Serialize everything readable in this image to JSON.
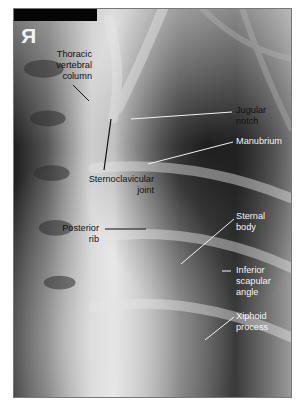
{
  "figure": {
    "orientation_marker": "R",
    "labels": {
      "thoracic_vertebral_column": [
        "Thoracic",
        "vertebral",
        "column"
      ],
      "sternoclavicular_joint": [
        "Sternoclavicular",
        "joint"
      ],
      "posterior_rib": [
        "Posterior",
        "rib"
      ],
      "jugular_notch": [
        "Jugular",
        "notch"
      ],
      "manubrium": [
        "Manubrium"
      ],
      "sternal_body": [
        "Sternal",
        "body"
      ],
      "inferior_scapular_angle": [
        "Inferior",
        "scapular",
        "angle"
      ],
      "xiphoid_process": [
        "Xiphoid",
        "process"
      ]
    },
    "colors": {
      "dark_label": "#111111",
      "light_label": "#f4f4f4",
      "frame": "#777777"
    }
  }
}
